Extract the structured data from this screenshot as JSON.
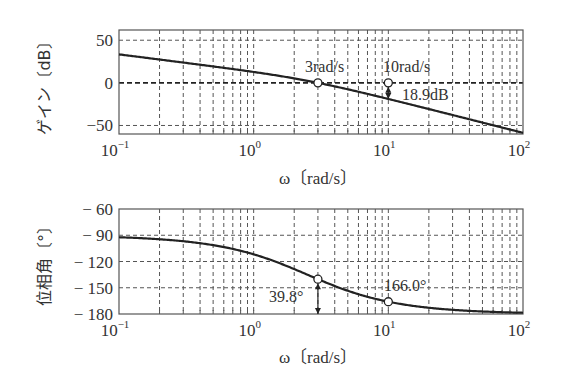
{
  "chart_data": [
    {
      "type": "line",
      "title": "",
      "xlabel": "ω〔rad/s〕",
      "ylabel": "ゲイン〔dB〕",
      "xscale": "log",
      "xlim": [
        0.1,
        100
      ],
      "ylim": [
        -60,
        62
      ],
      "xticks": [
        0.1,
        1,
        10,
        100
      ],
      "xtick_labels": [
        "10⁻¹",
        "10⁰",
        "10¹",
        "10²"
      ],
      "yticks": [
        50,
        0,
        -50
      ],
      "ytick_labels": [
        "50",
        "0",
        "−50"
      ],
      "grid": true,
      "series": [
        {
          "name": "gain",
          "x": [
            0.1,
            0.2,
            0.5,
            1,
            2,
            3,
            5,
            10,
            20,
            50,
            100
          ],
          "y": [
            33.4,
            27.4,
            19.3,
            12.7,
            5.3,
            0.0,
            -7.7,
            -18.9,
            -30.6,
            -46.5,
            -58.6
          ]
        }
      ],
      "markers": [
        {
          "x": 3,
          "y": 0,
          "label": "3rad/s"
        },
        {
          "x": 10,
          "y": 0,
          "label": "10rad/s"
        }
      ],
      "annotations": [
        {
          "text": "18.9dB",
          "x": 10,
          "y_from": 0,
          "y_to": -18.9,
          "note": "gain margin arrow"
        }
      ]
    },
    {
      "type": "line",
      "title": "",
      "xlabel": "ω〔rad/s〕",
      "ylabel": "位相角〔°〕",
      "xscale": "log",
      "xlim": [
        0.1,
        100
      ],
      "ylim": [
        -180,
        -60
      ],
      "xticks": [
        0.1,
        1,
        10,
        100
      ],
      "xtick_labels": [
        "10⁻¹",
        "10⁰",
        "10¹",
        "10²"
      ],
      "yticks": [
        -60,
        -90,
        -120,
        -150,
        -180
      ],
      "ytick_labels": [
        "− 60",
        "− 90",
        "− 120",
        "− 150",
        "− 180"
      ],
      "grid": true,
      "series": [
        {
          "name": "phase",
          "x": [
            0.1,
            0.2,
            0.5,
            1,
            2,
            3,
            5,
            10,
            20,
            50,
            100
          ],
          "y": [
            -92.3,
            -94.6,
            -101.3,
            -111.8,
            -128.7,
            -140.2,
            -153.4,
            -166.0,
            -172.9,
            -177.1,
            -178.6
          ]
        }
      ],
      "markers": [
        {
          "x": 3,
          "y": -140.2
        },
        {
          "x": 10,
          "y": -166.0,
          "label": "166.0°"
        }
      ],
      "annotations": [
        {
          "text": "39.8°",
          "x": 3,
          "y_from": -140.2,
          "y_to": -180,
          "note": "phase margin arrow"
        },
        {
          "text": "166.0°",
          "x": 10,
          "y": -166.0
        }
      ]
    }
  ],
  "labels": {
    "gain_ylabel": "ゲイン〔dB〕",
    "phase_ylabel": "位相角〔°〕",
    "xlabel_top": "ω〔rad/s〕",
    "xlabel_bottom": "ω〔rad/s〕",
    "marker_3": "3rad/s",
    "marker_10": "10rad/s",
    "gain_margin": "18.9dB",
    "phase_margin": "39.8°",
    "phase_at_10": "166.0°"
  },
  "colors": {
    "curve": "#222222",
    "grid": "#555555",
    "axis": "#555555"
  }
}
